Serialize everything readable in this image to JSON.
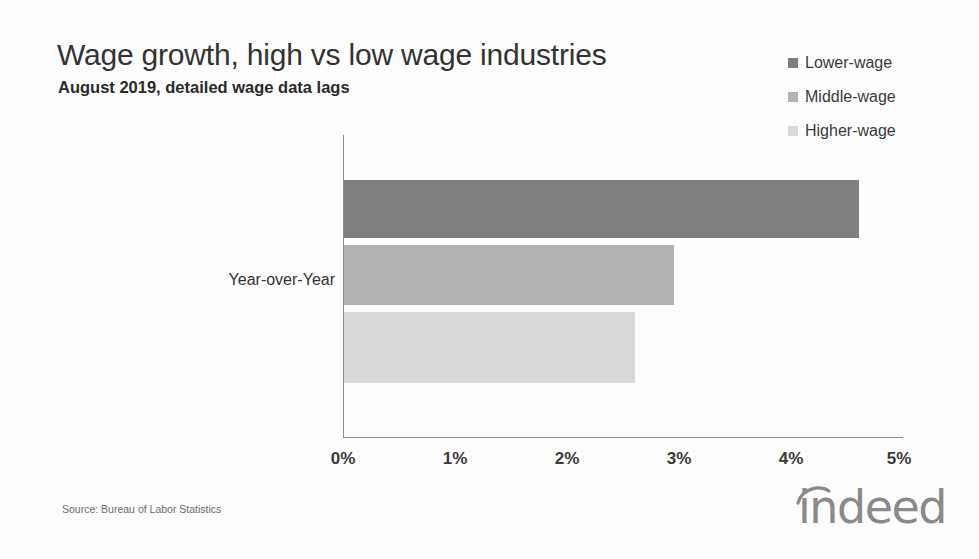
{
  "header": {
    "title": "Wage growth, high vs low wage industries",
    "subtitle": "August 2019, detailed wage data lags"
  },
  "footer": {
    "source": "Source: Bureau of Labor Statistics",
    "logo_text": "indeed",
    "logo_arc_icon": "arc-accent-icon"
  },
  "chart_data": {
    "type": "bar",
    "orientation": "horizontal",
    "title": "Wage growth, high vs low wage industries",
    "subtitle": "August 2019, detailed wage data lags",
    "xlabel": "",
    "ylabel": "",
    "categories": [
      "Year-over-Year"
    ],
    "series": [
      {
        "name": "Lower-wage",
        "values": [
          4.6
        ],
        "color": "#7f7f7f"
      },
      {
        "name": "Middle-wage",
        "values": [
          2.95
        ],
        "color": "#b2b2b2"
      },
      {
        "name": "Higher-wage",
        "values": [
          2.6
        ],
        "color": "#d9d9d9"
      }
    ],
    "xlim": [
      0,
      5
    ],
    "xticks": [
      0,
      1,
      2,
      3,
      4,
      5
    ],
    "xticklabels": [
      "0%",
      "1%",
      "2%",
      "3%",
      "4%",
      "5%"
    ],
    "value_unit": "percent",
    "grid": false,
    "legend_position": "top-right"
  }
}
